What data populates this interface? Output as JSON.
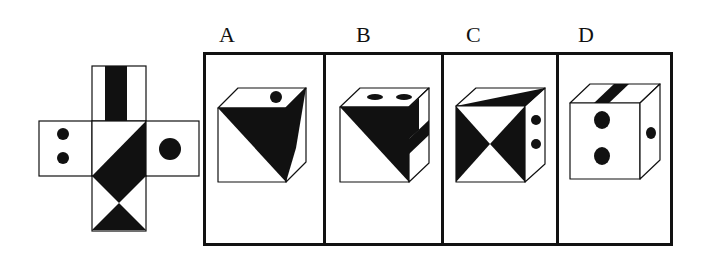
{
  "puzzle": {
    "net": {
      "faces": [
        {
          "position": "top",
          "pattern": "vertical-black-stripe"
        },
        {
          "position": "left",
          "pattern": "two-dots-vertical"
        },
        {
          "position": "center",
          "pattern": "diagonal-half-black"
        },
        {
          "position": "right",
          "pattern": "one-large-dot"
        },
        {
          "position": "below-center",
          "pattern": "upper-triangle-black"
        },
        {
          "position": "bottom",
          "pattern": "lower-triangle-black"
        }
      ]
    },
    "options": [
      {
        "label": "A"
      },
      {
        "label": "B"
      },
      {
        "label": "C"
      },
      {
        "label": "D"
      }
    ],
    "colors": {
      "ink": "#111111",
      "paper": "#ffffff"
    }
  }
}
